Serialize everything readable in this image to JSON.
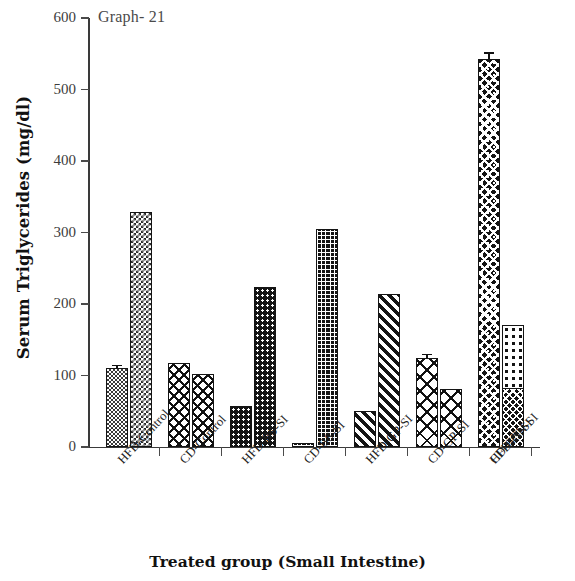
{
  "chart_data": {
    "type": "bar",
    "title": "Graph- 21",
    "xlabel": "Treated group (Small Intestine)",
    "ylabel": "Serum Triglycerides (mg/dl)",
    "ylim": [
      0,
      600
    ],
    "yticks": [
      0,
      100,
      200,
      300,
      400,
      500,
      600
    ],
    "ytick_labels": [
      "0",
      "100",
      "200",
      "300",
      "400",
      "500",
      "600"
    ],
    "grid": false,
    "legend": "none",
    "categories": [
      "HFD-Control",
      "CD-Control",
      "HFD-BS-SI",
      "CD-BS-SI",
      "HFD-GP-SI",
      "CD-GP-SI",
      "HFD-GN-SI",
      "CD-GN-SI"
    ],
    "bars": [
      {
        "group": "HFD-Control",
        "index": 0,
        "value": 110,
        "error": 3,
        "pattern": "check-fine",
        "x": 18,
        "width": 22
      },
      {
        "group": "HFD-Control",
        "index": 1,
        "value": 328,
        "error": 0,
        "pattern": "check-med",
        "x": 42,
        "width": 22
      },
      {
        "group": "CD-Control",
        "index": 2,
        "value": 118,
        "error": 0,
        "pattern": "diamond",
        "x": 80,
        "width": 22
      },
      {
        "group": "CD-Control",
        "index": 3,
        "value": 102,
        "error": 0,
        "pattern": "diamond",
        "x": 104,
        "width": 22
      },
      {
        "group": "HFD-BS-SI",
        "index": 4,
        "value": 57,
        "error": 0,
        "pattern": "dots-dark",
        "x": 142,
        "width": 22
      },
      {
        "group": "HFD-BS-SI",
        "index": 5,
        "value": 224,
        "error": 0,
        "pattern": "dots-dark",
        "x": 166,
        "width": 22
      },
      {
        "group": "CD-BS-SI",
        "index": 6,
        "value": 5,
        "error": 0,
        "pattern": "grid-dark",
        "x": 204,
        "width": 22
      },
      {
        "group": "CD-BS-SI",
        "index": 7,
        "value": 305,
        "error": 0,
        "pattern": "grid-dark",
        "x": 228,
        "width": 22
      },
      {
        "group": "HFD-GP-SI",
        "index": 8,
        "value": 51,
        "error": 0,
        "pattern": "hatch-thick",
        "x": 266,
        "width": 22
      },
      {
        "group": "HFD-GP-SI",
        "index": 9,
        "value": 214,
        "error": 0,
        "pattern": "hatch-thick",
        "x": 290,
        "width": 22
      },
      {
        "group": "CD-GP-SI",
        "index": 10,
        "value": 125,
        "error": 3,
        "pattern": "diamond-lg",
        "x": 328,
        "width": 22
      },
      {
        "group": "CD-GP-SI",
        "index": 11,
        "value": 81,
        "error": 0,
        "pattern": "diamond-lg",
        "x": 352,
        "width": 22
      },
      {
        "group": "HFD-GN-SI",
        "index": 12,
        "value": 101,
        "error": 2,
        "pattern": "dots-light",
        "x": 390,
        "width": 22
      },
      {
        "group": "HFD-GN-SI",
        "index": 13,
        "value": 171,
        "error": 0,
        "pattern": "dots-light",
        "x": 414,
        "width": 22
      },
      {
        "group": "CD-GN-SI",
        "index": 14,
        "value": 542,
        "error": 8,
        "pattern": "speckle",
        "x": 390,
        "width": 22
      },
      {
        "group": "CD-GN-SI",
        "index": 15,
        "value": 82,
        "error": 0,
        "pattern": "speckle-sm",
        "x": 414,
        "width": 22
      }
    ]
  }
}
